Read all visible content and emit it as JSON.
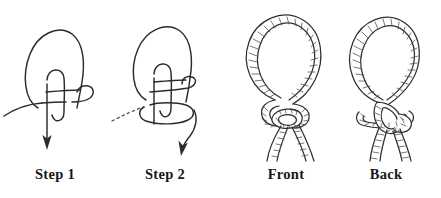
{
  "figure": {
    "background_color": "#ffffff",
    "ink_color": "#2b2b2b",
    "panel_count": 4
  },
  "panels": [
    {
      "id": "step-1",
      "label": "Step 1",
      "style": "line-drawing",
      "elements": [
        "large-loop",
        "inner-loop",
        "horizontal-strand",
        "down-arrow"
      ]
    },
    {
      "id": "step-2",
      "label": "Step 2",
      "style": "line-drawing",
      "elements": [
        "large-loop",
        "inner-loop",
        "horizontal-strand",
        "dashed-lead-line",
        "curved-down-arrow"
      ]
    },
    {
      "id": "front-view",
      "label": "Front",
      "style": "textured-rope",
      "elements": [
        "rope-loop",
        "knot",
        "two-tails"
      ]
    },
    {
      "id": "back-view",
      "label": "Back",
      "style": "textured-rope",
      "elements": [
        "rope-loop",
        "knot",
        "two-tails"
      ]
    }
  ]
}
